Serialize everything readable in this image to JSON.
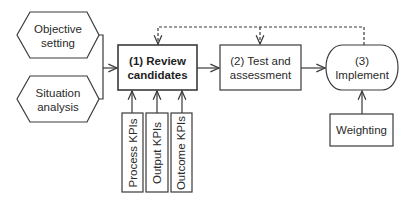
{
  "diagram": {
    "inputs": [
      {
        "id": "objective",
        "shape": "hexagon",
        "label": "Objective setting",
        "lines": [
          "Objective",
          "setting"
        ]
      },
      {
        "id": "situation",
        "shape": "hexagon",
        "label": "Situation analysis",
        "lines": [
          "Situation",
          "analysis"
        ]
      }
    ],
    "steps": [
      {
        "id": "review",
        "shape": "rectangle",
        "emphasis": "bold",
        "lines": [
          "(1) Review",
          "candidates"
        ]
      },
      {
        "id": "test",
        "shape": "rectangle",
        "lines": [
          "(2) Test and",
          "assessment"
        ]
      },
      {
        "id": "implement",
        "shape": "rounded",
        "lines": [
          "(3)",
          "Implement"
        ]
      }
    ],
    "kpis": [
      {
        "id": "process",
        "label": "Process KPIs"
      },
      {
        "id": "output",
        "label": "Output KPIs"
      },
      {
        "id": "outcome",
        "label": "Outcome KPIs"
      }
    ],
    "weighting": {
      "label": "Weighting"
    },
    "edges": [
      {
        "from": "objective",
        "to": "review",
        "style": "solid"
      },
      {
        "from": "situation",
        "to": "review",
        "style": "solid"
      },
      {
        "from": "review",
        "to": "test",
        "style": "solid"
      },
      {
        "from": "test",
        "to": "implement",
        "style": "solid"
      },
      {
        "from": "process",
        "to": "review",
        "style": "solid"
      },
      {
        "from": "output",
        "to": "review",
        "style": "solid"
      },
      {
        "from": "outcome",
        "to": "review",
        "style": "solid"
      },
      {
        "from": "weighting",
        "to": "implement",
        "style": "solid"
      },
      {
        "from": "implement",
        "to": "review",
        "style": "dashed"
      },
      {
        "from": "implement",
        "to": "test",
        "style": "dashed"
      }
    ],
    "colors": {
      "stroke": "#3a3a3a",
      "text": "#2a2a2a",
      "background": "#ffffff"
    }
  }
}
